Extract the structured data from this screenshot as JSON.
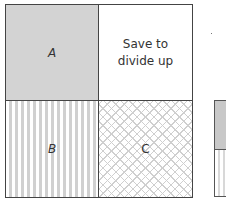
{
  "diagram": {
    "cells": [
      {
        "id": "A",
        "label": "A",
        "fill": "grey"
      },
      {
        "id": "save",
        "label_line1": "Save to",
        "label_line2": "divide up",
        "fill": "white"
      },
      {
        "id": "B",
        "label": "B",
        "fill": "vertical-stripes"
      },
      {
        "id": "C",
        "label": "C",
        "fill": "crosshatch"
      }
    ]
  },
  "colors": {
    "border": "#444444",
    "grey_fill": "#d3d3d3",
    "stripe": "#d0d0d0",
    "hatch": "#cfcfcf"
  }
}
